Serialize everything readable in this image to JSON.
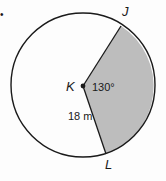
{
  "figure": {
    "bullet": "•",
    "center_label": "K",
    "point_top_label": "J",
    "point_bottom_label": "L",
    "central_angle_label": "130°",
    "radius_label": "18 m"
  },
  "colors": {
    "stroke": "#1a1a1a",
    "sector_fill": "#bdbdbd",
    "background": "#fdfdfd"
  }
}
